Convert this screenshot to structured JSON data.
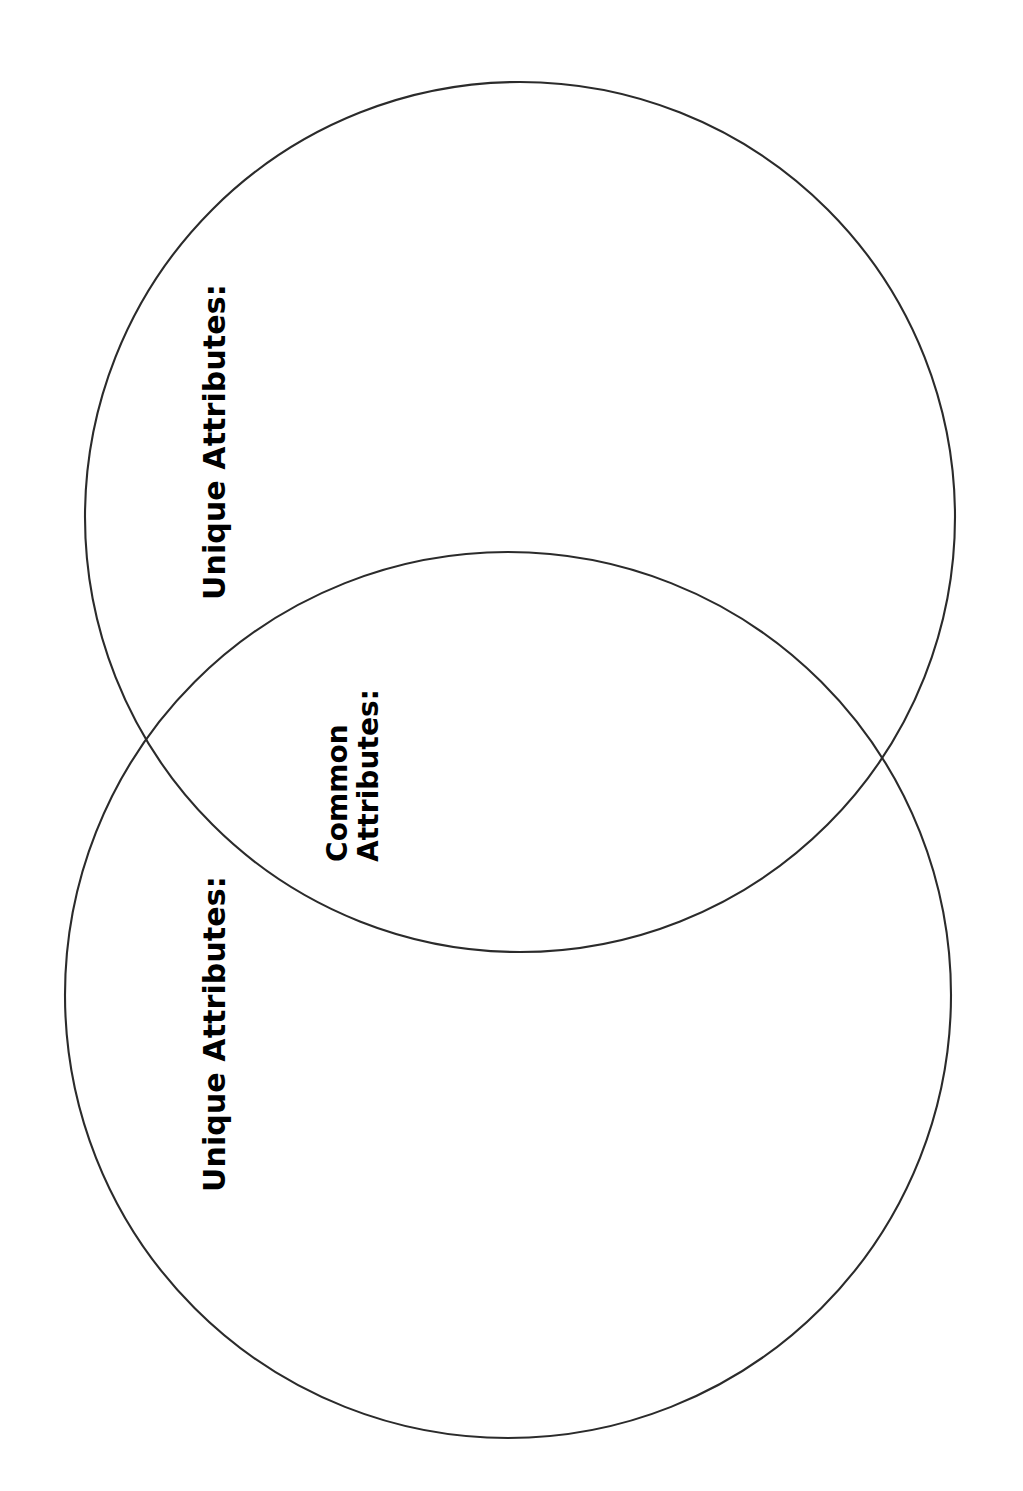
{
  "page": {
    "background_color": "#ffffff",
    "orientation": "portrait",
    "width": 1023,
    "height": 1491
  },
  "diagram": {
    "type": "venn",
    "set_count": 2,
    "stroke_color": "#2b2b2b",
    "fill_color": "none",
    "stroke_width": 2.1,
    "circles": [
      {
        "id": "top-circle",
        "name": "upper-set-circle",
        "cx": 520,
        "cy": 517,
        "r": 435
      },
      {
        "id": "bottom-circle",
        "name": "lower-set-circle",
        "cx": 508,
        "cy": 995,
        "r": 443
      }
    ],
    "intersections": [
      {
        "x": 135,
        "y": 760
      },
      {
        "x": 882,
        "y": 760
      }
    ]
  },
  "labels": {
    "unique_top": {
      "text": "Unique Attributes:",
      "rotation_deg": -90,
      "color": "#000000",
      "region": "upper-circle-only"
    },
    "common": {
      "line1": "Common",
      "line2": "Attributes:",
      "rotation_deg": -90,
      "color": "#000000",
      "region": "overlap-lens"
    },
    "unique_bottom": {
      "text": "Unique Attributes:",
      "rotation_deg": -90,
      "color": "#000000",
      "region": "lower-circle-only"
    }
  }
}
